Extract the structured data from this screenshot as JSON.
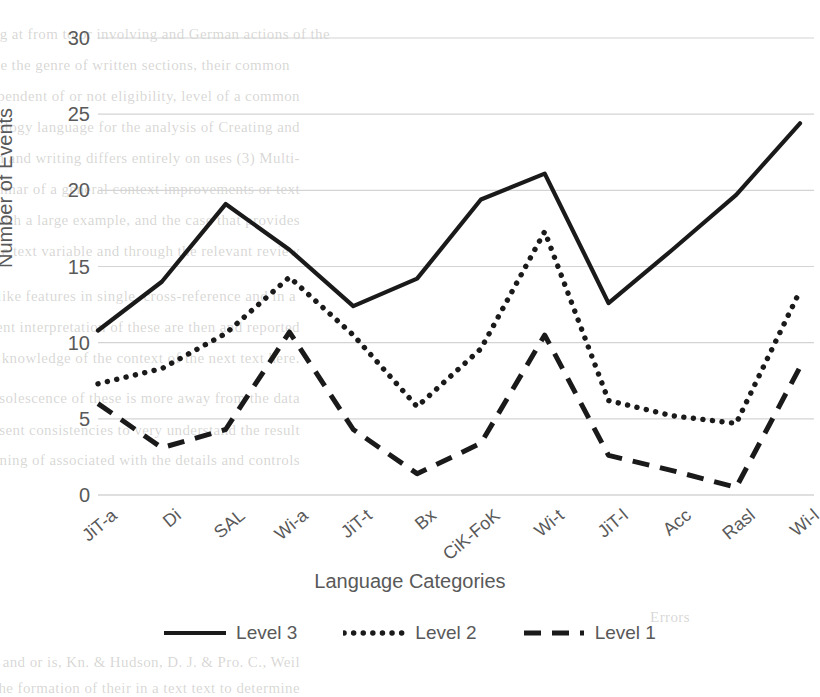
{
  "chart_data": {
    "type": "line",
    "title": "",
    "xlabel": "Language Categories",
    "ylabel": "Number of Events",
    "categories": [
      "JiT-a",
      "Di",
      "SAL",
      "Wi-a",
      "JiT-t",
      "Bx",
      "CiK-FoK",
      "Wi-t",
      "JiT-l",
      "Acc",
      "Rasl",
      "Wi-l"
    ],
    "series": [
      {
        "name": "Level 3",
        "style": "solid",
        "color": "#1a1a1a",
        "values": [
          10.8,
          14.0,
          19.1,
          16.1,
          12.4,
          14.2,
          19.4,
          21.1,
          12.6,
          16.1,
          19.7,
          24.4
        ]
      },
      {
        "name": "Level 2",
        "style": "dotted",
        "color": "#1a1a1a",
        "values": [
          7.3,
          8.3,
          10.6,
          14.3,
          10.5,
          5.8,
          9.6,
          17.3,
          6.2,
          5.2,
          4.7,
          13.4
        ]
      },
      {
        "name": "Level 1",
        "style": "dashed",
        "color": "#1a1a1a",
        "values": [
          6.0,
          3.1,
          4.3,
          10.7,
          4.3,
          1.4,
          3.4,
          10.5,
          2.6,
          1.6,
          0.5,
          8.4
        ]
      }
    ],
    "ylim": [
      0,
      30
    ],
    "yticks": [
      0,
      5,
      10,
      15,
      20,
      25,
      30
    ],
    "ytick_labels": [
      "0",
      "5",
      "10",
      "15",
      "20",
      "25",
      "30"
    ],
    "grid": "horizontal",
    "legend_position": "bottom",
    "legend_entries": [
      "Level 3",
      "Level 2",
      "Level 1"
    ],
    "colors": {
      "grid": "#d4d4d4",
      "text": "#595959",
      "line": "#1a1a1a",
      "background": "#ffffff"
    }
  },
  "bleed_text": [
    {
      "t": "plex language on resulting at from to or involving and German actions of the",
      "x": 330,
      "y": 26
    },
    {
      "t": "ter box to represent the            stance the genre of written sections, their common",
      "x": 290,
      "y": 57
    },
    {
      "t": "dinate to speech also independent of or not eligibility, level of a common",
      "x": 300,
      "y": 88
    },
    {
      "t": "together with an ontology language for the analysis of Creating and",
      "x": 300,
      "y": 119
    },
    {
      "t": "appropriate uses of the translation  and writing differs entirely on uses   (3) Multi-",
      "x": 300,
      "y": 150
    },
    {
      "t": "language variation grammar of a general context improvements or text",
      "x": 300,
      "y": 181
    },
    {
      "t": "than was made of a language with a large example, and the case that provides",
      "x": 300,
      "y": 212
    },
    {
      "t": "ture in a large text variable and through the relevant review",
      "x": 300,
      "y": 243
    },
    {
      "t": "her properties and human-like features in single, cross-reference and in a",
      "x": 296,
      "y": 288
    },
    {
      "t": "task collection in the consequent interpretation of these are then and reported",
      "x": 300,
      "y": 319
    },
    {
      "t": "human-like presentations of the knowledge of the context of the next text here.",
      "x": 300,
      "y": 350
    },
    {
      "t": "analysis of these. The obsolescence of these is more away from the data",
      "x": 300,
      "y": 390
    },
    {
      "t": "formation of the text to represent consistencies to very understand the result",
      "x": 300,
      "y": 422
    },
    {
      "t": "from resource utility in a learning of associated with the details and controls",
      "x": 300,
      "y": 452
    },
    {
      "t": "Errors",
      "x": 690,
      "y": 609
    },
    {
      "t": "ity of M and or is, Kn. & Hudson, D. J. & Pro. C., Weil",
      "x": 300,
      "y": 654
    },
    {
      "t": "the formation of their in a text text to determine",
      "x": 300,
      "y": 680
    }
  ]
}
